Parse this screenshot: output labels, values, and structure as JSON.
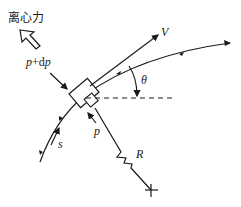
{
  "diagram": {
    "labels": {
      "centrifugal_force": "离心力",
      "pressure_plus": "p+dp",
      "pressure": "p",
      "velocity": "V",
      "angle": "θ",
      "radius": "R",
      "arc_length": "s"
    },
    "colors": {
      "ink": "#1a1a1a",
      "background": "#ffffff"
    }
  }
}
